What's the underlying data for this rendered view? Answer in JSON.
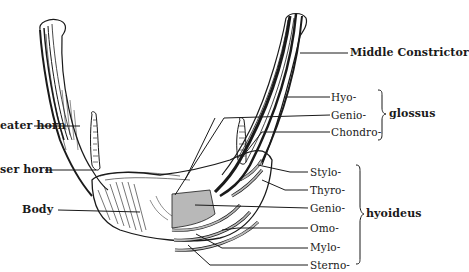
{
  "diagram": {
    "colors": {
      "ink": "#1a1a1a",
      "shading": "#b8b8b8",
      "background": "#ffffff"
    },
    "left_labels": [
      {
        "id": "greater-horn",
        "text": "eater horn"
      },
      {
        "id": "lesser-horn",
        "text": "ser horn"
      },
      {
        "id": "body",
        "text": "Body"
      }
    ],
    "top_right_labels": [
      {
        "id": "middle-constrictor",
        "text": "Middle Constrictor"
      }
    ],
    "glossus_group": {
      "group_label": "glossus",
      "items": [
        "Hyo-",
        "Genio-",
        "Chondro-"
      ]
    },
    "hyoideus_group": {
      "group_label": "hyoideus",
      "items": [
        "Stylo-",
        "Thyro-",
        "Genio-",
        "Omo-",
        "Mylo-",
        "Sterno-"
      ]
    }
  }
}
